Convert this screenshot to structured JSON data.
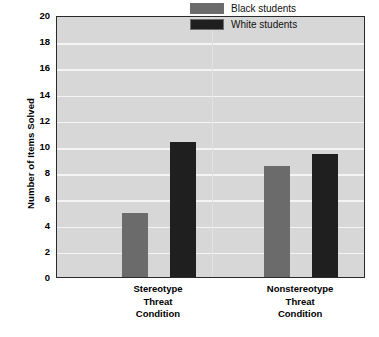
{
  "chart_data": {
    "type": "bar",
    "title": "",
    "xlabel": "",
    "ylabel": "Number of Items Solved",
    "ylim": [
      0,
      20
    ],
    "ytick_step": 2,
    "yticks": [
      20,
      18,
      16,
      14,
      12,
      10,
      8,
      6,
      4,
      2,
      0
    ],
    "ytick_labels": [
      "20",
      "18",
      "16",
      "14",
      "12",
      "10",
      "8",
      "6",
      "4",
      "2",
      "0"
    ],
    "grid": true,
    "grid_axis": "y",
    "legend_position": "top-right",
    "categories": [
      "Stereotype Threat Condition",
      "Nonstereotype Threat Condition"
    ],
    "category_label_lines": [
      [
        "Stereotype",
        "Threat",
        "Condition"
      ],
      [
        "Nonstereotype",
        "Threat",
        "Condition"
      ]
    ],
    "series": [
      {
        "name": "Black students",
        "color": "#6b6b6b",
        "values": [
          4.9,
          8.5
        ]
      },
      {
        "name": "White students",
        "color": "#1f1f1f",
        "values": [
          10.3,
          9.4
        ]
      }
    ]
  },
  "legend": {
    "items": [
      {
        "label": "Black students",
        "color": "#6b6b6b"
      },
      {
        "label": "White students",
        "color": "#1f1f1f"
      }
    ]
  },
  "colors": {
    "plot_background": "#d7d7d7",
    "gridline": "#f4f4f4",
    "axis_border": "#2a2a2a",
    "page_background": "#ffffff",
    "black_students_bar": "#6b6b6b",
    "white_students_bar": "#1f1f1f",
    "text": "#000000"
  }
}
